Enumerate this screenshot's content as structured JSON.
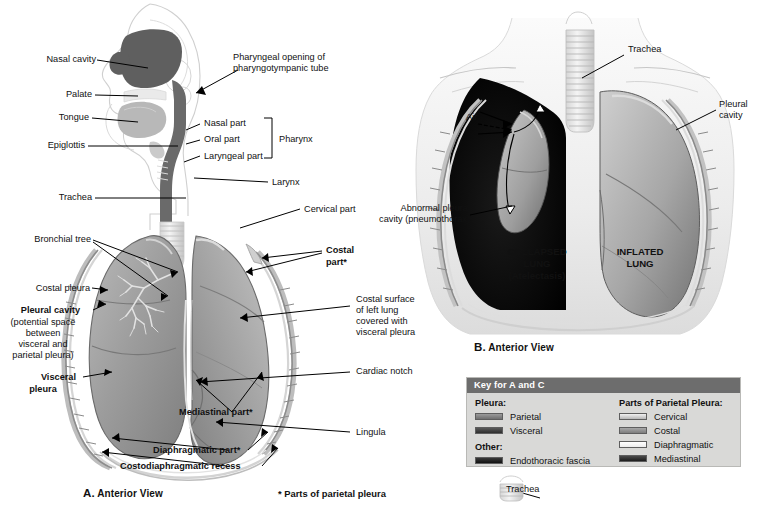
{
  "figure": {
    "background": "#ffffff"
  },
  "panel_a": {
    "caption_letter": "A.",
    "caption_text": "Anterior View",
    "footnote": "* Parts of parietal pleura",
    "labels": {
      "nasal_cavity": "Nasal cavity",
      "palate": "Palate",
      "tongue": "Tongue",
      "epiglottis": "Epiglottis",
      "trachea": "Trachea",
      "pharyngeal_opening_l1": "Pharyngeal opening of",
      "pharyngeal_opening_l2": "pharyngotympanic tube",
      "nasal_part": "Nasal part",
      "oral_part": "Oral part",
      "laryngeal_part": "Laryngeal part",
      "pharynx": "Pharynx",
      "larynx": "Larynx",
      "cervical_part": "Cervical part",
      "bronchial_tree": "Bronchial tree",
      "costal_pleura": "Costal pleura",
      "pleural_cavity_title": "Pleural cavity",
      "pleural_cavity_l1": "(potential space",
      "pleural_cavity_l2": "between",
      "pleural_cavity_l3": "visceral and",
      "pleural_cavity_l4": "parietal pleura)",
      "visceral_pleura_l1": "Visceral",
      "visceral_pleura_l2": "pleura",
      "costal_part_l1": "Costal",
      "costal_part_l2": "part*",
      "costal_surface_l1": "Costal surface",
      "costal_surface_l2": "of left lung",
      "costal_surface_l3": "covered with",
      "costal_surface_l4": "visceral pleura",
      "cardiac_notch": "Cardiac notch",
      "lingula": "Lingula",
      "mediastinal_part": "Mediastinal part*",
      "diaphragmatic_part": "Diaphragmatic part*",
      "costodiaphragmatic_recess": "Costodiaphragmatic recess"
    }
  },
  "panel_b": {
    "caption_letter": "B.",
    "caption_text": "Anterior View",
    "labels": {
      "trachea": "Trachea",
      "pleural_cavity_l1": "Pleural",
      "pleural_cavity_l2": "cavity",
      "air": "Air",
      "abnormal_l1": "Abnormal pleural",
      "abnormal_l2": "cavity (pneumothorax)",
      "collapsed_l1": "COLLAPSED",
      "collapsed_l2": "LUNG",
      "collapsed_l3": "(Atelectasis)",
      "inflated_l1": "INFLATED",
      "inflated_l2": "LUNG"
    }
  },
  "key": {
    "header": "Key for A and C",
    "left_title": "Pleura:",
    "left_items": [
      {
        "label": "Parietal",
        "swatch": "swatch-parietal"
      },
      {
        "label": "Visceral",
        "swatch": "swatch-visceral"
      }
    ],
    "other_title": "Other:",
    "other_items": [
      {
        "label": "Endothoracic fascia",
        "swatch": "swatch-endo"
      }
    ],
    "right_title": "Parts of Parietal Pleura:",
    "right_items": [
      {
        "label": "Cervical",
        "swatch": "swatch-cervical"
      },
      {
        "label": "Costal",
        "swatch": "swatch-costal"
      },
      {
        "label": "Diaphragmatic",
        "swatch": "swatch-diaphragmatic"
      },
      {
        "label": "Mediastinal",
        "swatch": "swatch-mediastinal"
      }
    ],
    "trachea_key_label": "Trachea"
  }
}
